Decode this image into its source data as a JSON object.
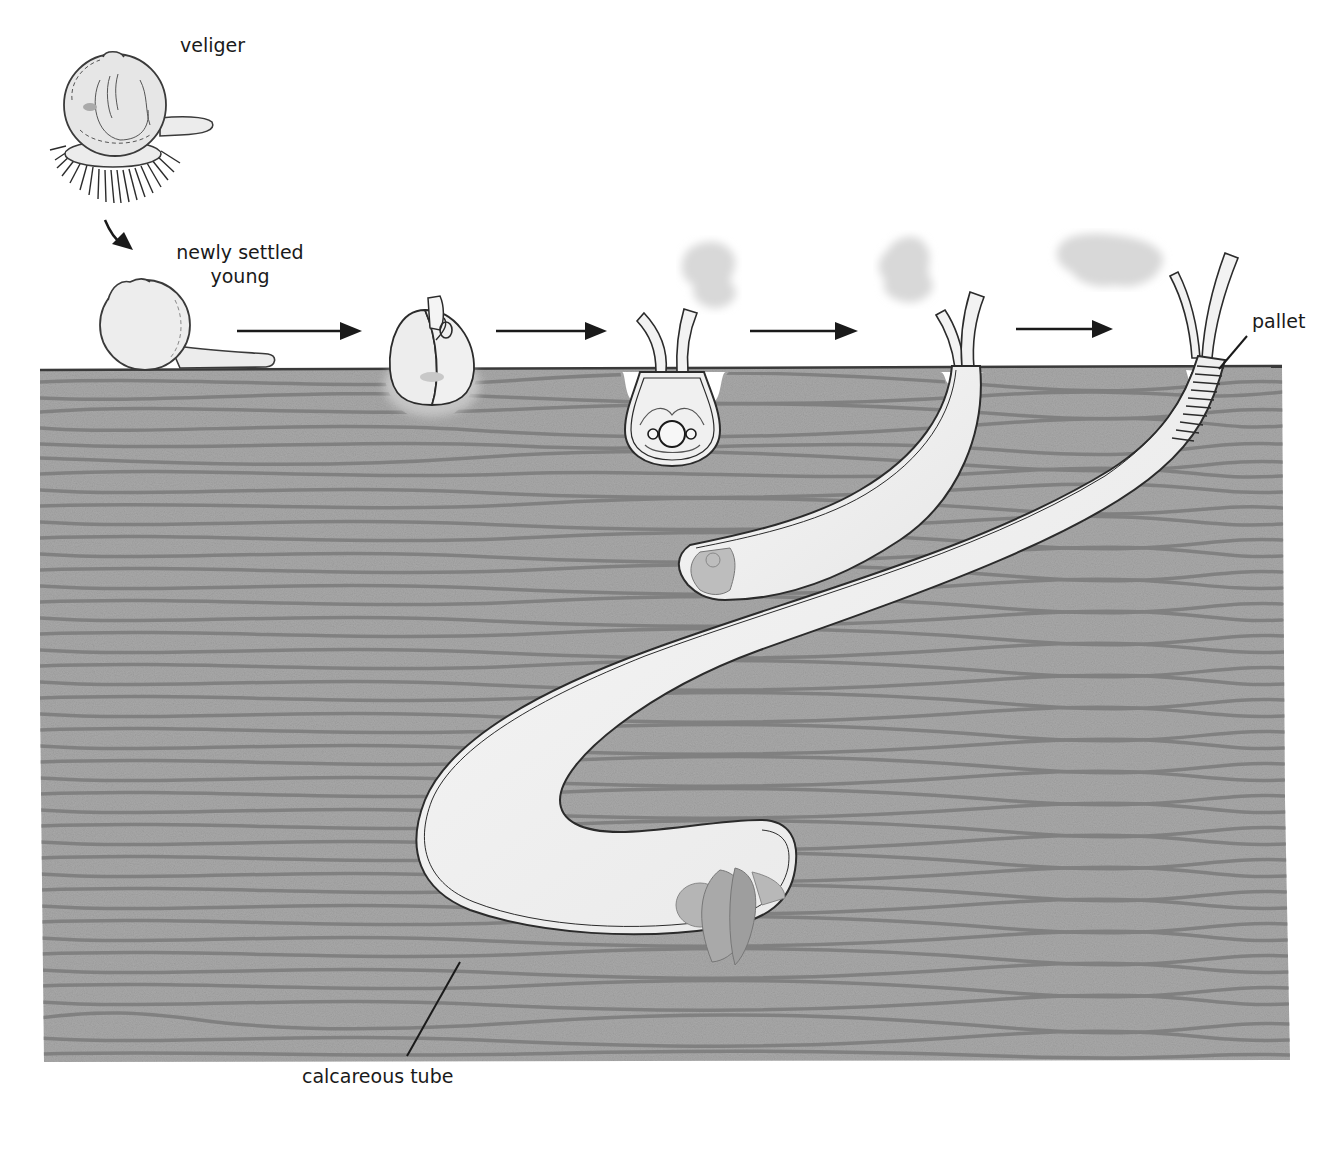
{
  "diagram": {
    "stages": [
      {
        "id": "veliger",
        "label": "veliger"
      },
      {
        "id": "settled",
        "label": "newly settled young",
        "label_line1": "newly settled",
        "label_line2": "young"
      },
      {
        "id": "metamorphosing",
        "label": ""
      },
      {
        "id": "early-burrow",
        "label": ""
      },
      {
        "id": "juvenile-tube",
        "label": ""
      },
      {
        "id": "adult",
        "label": ""
      }
    ],
    "callouts": {
      "pallet": "pallet",
      "tube": "calcareous tube"
    },
    "arrows": [
      {
        "from": "veliger",
        "to": "settled"
      },
      {
        "from": "settled",
        "to": "metamorphosing"
      },
      {
        "from": "metamorphosing",
        "to": "early-burrow"
      },
      {
        "from": "early-burrow",
        "to": "juvenile-tube"
      },
      {
        "from": "juvenile-tube",
        "to": "adult"
      }
    ],
    "colors": {
      "wood": "#a9a9a9",
      "wood_grain": "#7b7b7b",
      "outline": "#2b2b2b",
      "tube_fill": "#f1f1f1",
      "siphon_cloud": "#d9d9d9",
      "text": "#1a1a1a"
    }
  }
}
